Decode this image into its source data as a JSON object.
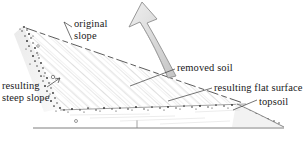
{
  "figure": {
    "labels": {
      "original_slope_line1": "original",
      "original_slope_line2": "slope",
      "removed_soil": "removed soil",
      "resulting_flat_surface": "resulting flat surface",
      "topsoil": "topsoil",
      "resulting_steep_slope_line1": "resulting",
      "resulting_steep_slope_line2": "steep slope"
    },
    "colors": {
      "ink": "#1a1a1a",
      "hatch": "#b9b9b9",
      "stipple": "#3a3a3a",
      "arrow_fill": "#e2e2e2",
      "arrow_stroke": "#8a8a8a",
      "ground_line": "#6f6f6f",
      "shade": "#ededed"
    },
    "elements": {
      "arrow": "curved-up-arrow",
      "hatched_region": "removed-soil-wedge",
      "stipple_band": "topsoil-layer",
      "baseline": "ground-datum-line"
    }
  }
}
